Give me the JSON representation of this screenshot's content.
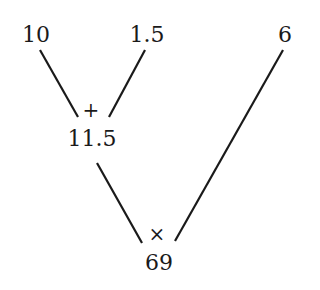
{
  "diagram": {
    "type": "expression-tree",
    "leaves": [
      {
        "id": "a",
        "label": "10"
      },
      {
        "id": "b",
        "label": "1.5"
      },
      {
        "id": "c",
        "label": "6"
      }
    ],
    "nodes": [
      {
        "id": "sum",
        "operator": "+",
        "label": "11.5",
        "children": [
          "a",
          "b"
        ]
      },
      {
        "id": "product",
        "operator": "×",
        "label": "69",
        "children": [
          "sum",
          "c"
        ]
      }
    ],
    "line_color": "#1a1a1a"
  }
}
